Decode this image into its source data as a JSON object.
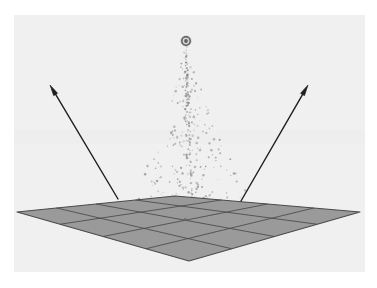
{
  "figure": {
    "type": "3d-perspective-schematic",
    "canvas": {
      "width": 377,
      "height": 288
    },
    "background": {
      "page_color": "#ffffff",
      "plot_color": "#f0f0f0",
      "plot_rect": {
        "x": 14,
        "y": 15,
        "width": 351,
        "height": 257
      }
    }
  },
  "detector_plane": {
    "name": "ground-detector-array",
    "fill_color": "#9a9a9a",
    "stroke_color": "#4a4a4a",
    "grid_rows": 4,
    "grid_cols": 4,
    "corners": {
      "left": {
        "x": 17,
        "y": 212
      },
      "far": {
        "x": 175,
        "y": 196
      },
      "right": {
        "x": 360,
        "y": 212
      },
      "near": {
        "x": 189,
        "y": 261
      }
    }
  },
  "shower": {
    "name": "particle-shower",
    "primary_vertex": {
      "x": 186,
      "y": 41
    },
    "vertex_radius": 4.2,
    "vertex_color": "#4d4d4d",
    "core_axis_x": 186,
    "axis_tilt": 0.04,
    "top_y": 50,
    "bottom_y": 205,
    "particle_count": 290,
    "particle_color": "#8e8e8e",
    "spread_top": 3,
    "spread_bottom": 62,
    "lateral_power": 2.1,
    "seed": 20240517
  },
  "arrows": [
    {
      "name": "left-arrow",
      "from": {
        "x": 118,
        "y": 199
      },
      "to": {
        "x": 50,
        "y": 85
      },
      "color": "#1f1f1f",
      "width": 1.4,
      "head_length": 11,
      "head_width": 4.6
    },
    {
      "name": "right-arrow",
      "from": {
        "x": 241,
        "y": 201
      },
      "to": {
        "x": 308,
        "y": 85
      },
      "color": "#1f1f1f",
      "width": 1.4,
      "head_length": 11,
      "head_width": 4.6
    }
  ],
  "chart_data": {
    "type": "scatter",
    "xlabel": "",
    "ylabel": "",
    "legend": [],
    "annotations": [
      {
        "label": "shower core vertex",
        "x": 186,
        "y": 41
      },
      {
        "label": "left detector signal direction",
        "x": 50,
        "y": 85
      },
      {
        "label": "right detector signal direction",
        "x": 308,
        "y": 85
      }
    ],
    "series": [
      {
        "name": "secondary particles",
        "description": "Cone of shower secondaries widening from the primary interaction vertex down to the detector plane",
        "n_points": 290,
        "x_center": 186,
        "y_range": [
          50,
          205
        ],
        "spread_at_top": 3,
        "spread_at_bottom": 62
      }
    ]
  }
}
